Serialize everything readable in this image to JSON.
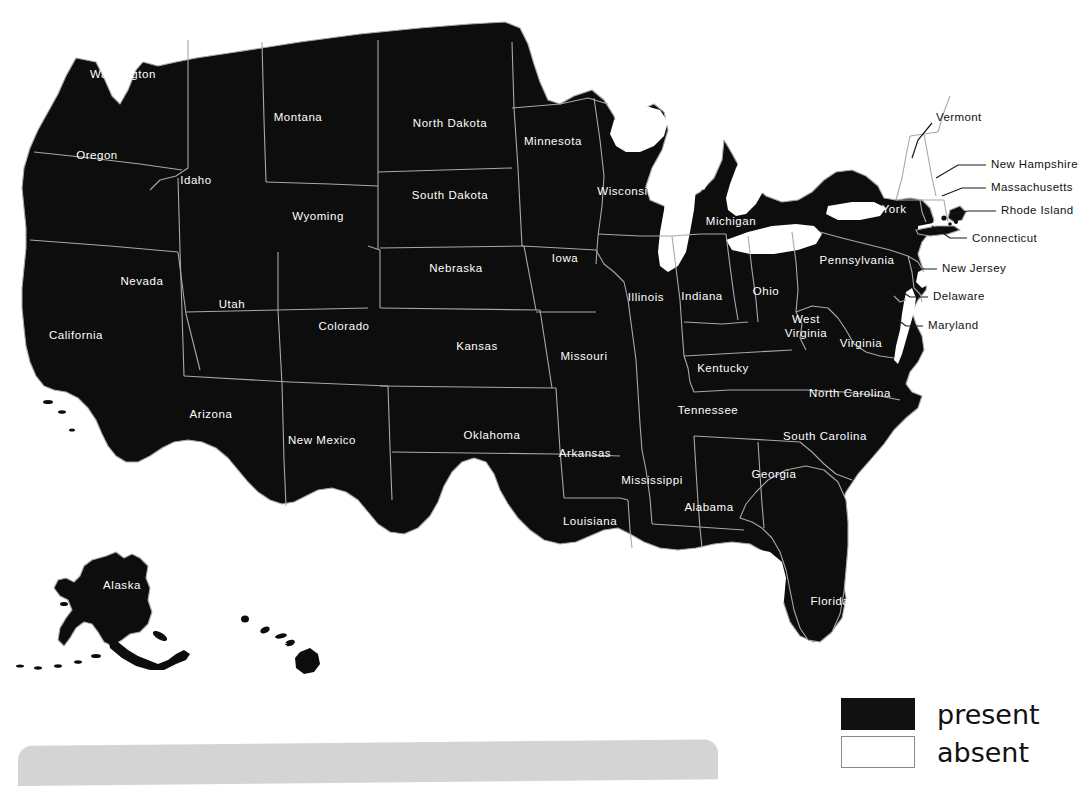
{
  "figure": {
    "type": "choropleth-map",
    "region": "United States",
    "background_color": "#ffffff"
  },
  "legend": {
    "position": "bottom-right",
    "items": [
      {
        "label": "present",
        "swatch": "filled",
        "color": "#111111"
      },
      {
        "label": "absent",
        "swatch": "outline",
        "color": "#ffffff"
      }
    ]
  },
  "map_data": {
    "type": "choropleth",
    "categories": [
      "present",
      "absent"
    ],
    "colors": {
      "present": "#0d0d0d",
      "absent": "#ffffff"
    },
    "water_color": "#ffffff",
    "border_color": "#a8a8a8",
    "states": [
      {
        "name": "Washington",
        "status": "present",
        "label_x": 123,
        "label_y": 75,
        "label_placement": "inside"
      },
      {
        "name": "Oregon",
        "status": "present",
        "label_x": 97,
        "label_y": 156,
        "label_placement": "inside"
      },
      {
        "name": "Idaho",
        "status": "present",
        "label_x": 196,
        "label_y": 181,
        "label_placement": "inside"
      },
      {
        "name": "Montana",
        "status": "present",
        "label_x": 298,
        "label_y": 118,
        "label_placement": "inside"
      },
      {
        "name": "Wyoming",
        "status": "present",
        "label_x": 318,
        "label_y": 217,
        "label_placement": "inside"
      },
      {
        "name": "Nevada",
        "status": "present",
        "label_x": 142,
        "label_y": 282,
        "label_placement": "inside"
      },
      {
        "name": "Utah",
        "status": "present",
        "label_x": 232,
        "label_y": 305,
        "label_placement": "inside"
      },
      {
        "name": "California",
        "status": "present",
        "label_x": 76,
        "label_y": 336,
        "label_placement": "inside"
      },
      {
        "name": "Arizona",
        "status": "present",
        "label_x": 211,
        "label_y": 415,
        "label_placement": "inside"
      },
      {
        "name": "Colorado",
        "status": "present",
        "label_x": 344,
        "label_y": 327,
        "label_placement": "inside"
      },
      {
        "name": "New Mexico",
        "status": "present",
        "label_x": 322,
        "label_y": 441,
        "label_placement": "inside"
      },
      {
        "name": "North Dakota",
        "status": "present",
        "label_x": 450,
        "label_y": 124,
        "label_placement": "inside"
      },
      {
        "name": "South Dakota",
        "status": "present",
        "label_x": 450,
        "label_y": 196,
        "label_placement": "inside"
      },
      {
        "name": "Nebraska",
        "status": "present",
        "label_x": 456,
        "label_y": 269,
        "label_placement": "inside"
      },
      {
        "name": "Kansas",
        "status": "present",
        "label_x": 477,
        "label_y": 347,
        "label_placement": "inside"
      },
      {
        "name": "Oklahoma",
        "status": "present",
        "label_x": 492,
        "label_y": 436,
        "label_placement": "inside"
      },
      {
        "name": "Texas",
        "status": "present",
        "label_x": 447,
        "label_y": 525,
        "label_placement": "inside"
      },
      {
        "name": "Minnesota",
        "status": "present",
        "label_x": 553,
        "label_y": 142,
        "label_placement": "inside"
      },
      {
        "name": "Iowa",
        "status": "present",
        "label_x": 565,
        "label_y": 259,
        "label_placement": "inside"
      },
      {
        "name": "Missouri",
        "status": "present",
        "label_x": 584,
        "label_y": 357,
        "label_placement": "inside"
      },
      {
        "name": "Arkansas",
        "status": "present",
        "label_x": 585,
        "label_y": 454,
        "label_placement": "inside"
      },
      {
        "name": "Louisiana",
        "status": "present",
        "label_x": 590,
        "label_y": 522,
        "label_placement": "inside"
      },
      {
        "name": "Wisconsin",
        "status": "present",
        "label_x": 626,
        "label_y": 192,
        "label_placement": "inside"
      },
      {
        "name": "Illinois",
        "status": "present",
        "label_x": 646,
        "label_y": 298,
        "label_placement": "inside"
      },
      {
        "name": "Mississippi",
        "status": "present",
        "label_x": 652,
        "label_y": 481,
        "label_placement": "inside"
      },
      {
        "name": "Michigan",
        "status": "present",
        "label_x": 731,
        "label_y": 222,
        "label_placement": "inside"
      },
      {
        "name": "Indiana",
        "status": "present",
        "label_x": 702,
        "label_y": 297,
        "label_placement": "inside"
      },
      {
        "name": "Kentucky",
        "status": "present",
        "label_x": 723,
        "label_y": 369,
        "label_placement": "inside"
      },
      {
        "name": "Tennessee",
        "status": "present",
        "label_x": 708,
        "label_y": 411,
        "label_placement": "inside"
      },
      {
        "name": "Alabama",
        "status": "present",
        "label_x": 709,
        "label_y": 508,
        "label_placement": "inside"
      },
      {
        "name": "Ohio",
        "status": "present",
        "label_x": 766,
        "label_y": 292,
        "label_placement": "inside"
      },
      {
        "name": "West Virginia",
        "status": "present",
        "label_x": 806,
        "label_y": 327,
        "label_placement": "inside",
        "two_line": true
      },
      {
        "name": "Virginia",
        "status": "present",
        "label_x": 861,
        "label_y": 344,
        "label_placement": "inside"
      },
      {
        "name": "North Carolina",
        "status": "present",
        "label_x": 850,
        "label_y": 394,
        "label_placement": "inside"
      },
      {
        "name": "South Carolina",
        "status": "present",
        "label_x": 825,
        "label_y": 437,
        "label_placement": "inside"
      },
      {
        "name": "Georgia",
        "status": "present",
        "label_x": 774,
        "label_y": 475,
        "label_placement": "inside"
      },
      {
        "name": "Florida",
        "status": "present",
        "label_x": 830,
        "label_y": 602,
        "label_placement": "inside"
      },
      {
        "name": "New York",
        "status": "present",
        "label_x": 880,
        "label_y": 210,
        "label_placement": "inside"
      },
      {
        "name": "Pennsylvania",
        "status": "present",
        "label_x": 857,
        "label_y": 261,
        "label_placement": "inside"
      },
      {
        "name": "Maine",
        "status": "present",
        "label_x": 985,
        "label_y": 115,
        "label_placement": "inside"
      },
      {
        "name": "Vermont",
        "status": "present",
        "label_x": 888,
        "label_y": 118,
        "label_placement": "outside-left",
        "leader": true
      },
      {
        "name": "New Hampshire",
        "status": "present",
        "label_x": 991,
        "label_y": 165,
        "label_placement": "outside-right",
        "leader": true
      },
      {
        "name": "Massachusetts",
        "status": "present",
        "label_x": 991,
        "label_y": 188,
        "label_placement": "outside-right",
        "leader": true
      },
      {
        "name": "Rhode Island",
        "status": "present",
        "label_x": 1001,
        "label_y": 211,
        "label_placement": "outside-right",
        "leader": true
      },
      {
        "name": "Connecticut",
        "status": "present",
        "label_x": 972,
        "label_y": 239,
        "label_placement": "outside-right",
        "leader": true
      },
      {
        "name": "New Jersey",
        "status": "present",
        "label_x": 942,
        "label_y": 269,
        "label_placement": "outside-right",
        "leader": true
      },
      {
        "name": "Delaware",
        "status": "present",
        "label_x": 933,
        "label_y": 297,
        "label_placement": "outside-right",
        "leader": true
      },
      {
        "name": "Maryland",
        "status": "present",
        "label_x": 928,
        "label_y": 326,
        "label_placement": "outside-right",
        "leader": true
      },
      {
        "name": "Alaska",
        "status": "present",
        "label_x": 122,
        "label_y": 586,
        "label_placement": "inside"
      },
      {
        "name": "Hawaii",
        "status": "present",
        "label_x": 269,
        "label_y": 648,
        "label_placement": "inside"
      }
    ],
    "present_count": 50,
    "absent_count": 0
  }
}
